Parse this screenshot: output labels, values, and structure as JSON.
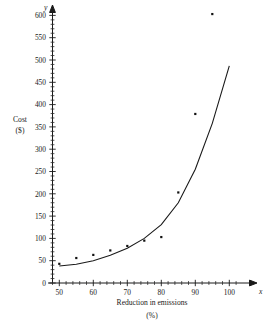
{
  "chart_data": {
    "type": "scatter",
    "title": "",
    "xlabel": "Reduction in emissions",
    "xlabel_unit": "(%)",
    "ylabel": "Cost",
    "ylabel_unit": "($)",
    "x_axis_variable": "x",
    "y_axis_variable": "y",
    "xlim": [
      48,
      102
    ],
    "ylim": [
      0,
      615
    ],
    "x_ticks": [
      50,
      60,
      70,
      80,
      90,
      100
    ],
    "y_ticks": [
      0,
      50,
      100,
      150,
      200,
      250,
      300,
      350,
      400,
      450,
      500,
      550,
      600
    ],
    "x_tick_labels": [
      "50",
      "60",
      "70",
      "80",
      "90",
      "100"
    ],
    "y_tick_labels": [
      "0",
      "50",
      "100",
      "150",
      "200",
      "250",
      "300",
      "350",
      "400",
      "450",
      "500",
      "550",
      "600"
    ],
    "x_minor_tick_step": 2,
    "y_minor_tick_step": 10,
    "grid": false,
    "legend": false,
    "legend_position": "none",
    "points": [
      {
        "x": 50,
        "y": 43
      },
      {
        "x": 55,
        "y": 56
      },
      {
        "x": 60,
        "y": 63
      },
      {
        "x": 65,
        "y": 73
      },
      {
        "x": 70,
        "y": 83
      },
      {
        "x": 75,
        "y": 95
      },
      {
        "x": 80,
        "y": 103
      },
      {
        "x": 85,
        "y": 203
      },
      {
        "x": 90,
        "y": 379
      },
      {
        "x": 95,
        "y": 603
      }
    ],
    "series": [
      {
        "name": "Cost data",
        "type": "scatter",
        "marker": "square",
        "categories": [
          50,
          55,
          60,
          65,
          70,
          75,
          80,
          85,
          90,
          95
        ],
        "values": [
          43,
          56,
          63,
          73,
          83,
          95,
          103,
          203,
          379,
          603
        ]
      },
      {
        "name": "Exponential fit curve",
        "type": "line",
        "x_start": 50,
        "x_end": 100,
        "y_start": 38,
        "y_end": 487,
        "curve_points": [
          {
            "x": 50,
            "y": 38
          },
          {
            "x": 55,
            "y": 42
          },
          {
            "x": 60,
            "y": 50
          },
          {
            "x": 65,
            "y": 62
          },
          {
            "x": 70,
            "y": 78
          },
          {
            "x": 75,
            "y": 100
          },
          {
            "x": 80,
            "y": 131
          },
          {
            "x": 85,
            "y": 180
          },
          {
            "x": 90,
            "y": 255
          },
          {
            "x": 95,
            "y": 358
          },
          {
            "x": 100,
            "y": 487
          }
        ]
      }
    ],
    "colors": {
      "axis": "#1a1a1a",
      "curve": "#1a1a1a",
      "point": "#111111",
      "background": "#ffffff"
    }
  }
}
